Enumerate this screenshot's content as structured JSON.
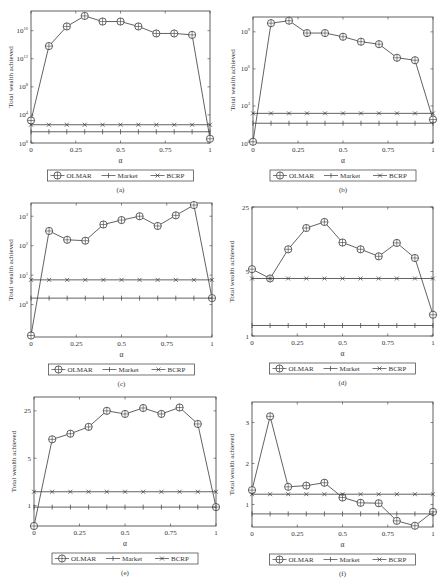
{
  "header": {
    "running_title": "",
    "page_number": ""
  },
  "legend": {
    "entries": [
      {
        "name": "OLMAR",
        "marker": "circle-cross"
      },
      {
        "name": "Market",
        "marker": "plus"
      },
      {
        "name": "BCRP",
        "marker": "x"
      }
    ]
  },
  "chart_data": [
    {
      "panel": "(a)",
      "type": "line",
      "xlabel": "α",
      "ylabel": "Total wealth achieved",
      "yscale": "log",
      "x": [
        0,
        0.1,
        0.2,
        0.3,
        0.4,
        0.5,
        0.6,
        0.7,
        0.8,
        0.9,
        1.0
      ],
      "xticks": [
        0,
        0.25,
        0.5,
        0.75,
        1
      ],
      "xtick_labels": [
        "0",
        "0.25",
        "0.5",
        "0.75",
        "1"
      ],
      "ylim_log10": [
        0,
        18.8
      ],
      "yticks_log10": [
        0,
        4,
        8,
        12,
        16
      ],
      "ytick_labels": [
        "10^0",
        "10^4",
        "10^8",
        "10^12",
        "10^16"
      ],
      "series": [
        {
          "name": "OLMAR",
          "log10_values": [
            3.2,
            13.8,
            16.6,
            18.1,
            17.3,
            17.3,
            16.6,
            15.6,
            15.6,
            15.4,
            0.6
          ]
        },
        {
          "name": "Market",
          "log10_values": [
            1.6,
            1.6,
            1.6,
            1.6,
            1.6,
            1.6,
            1.6,
            1.6,
            1.6,
            1.6,
            1.6
          ]
        },
        {
          "name": "BCRP",
          "log10_values": [
            2.6,
            2.6,
            2.6,
            2.6,
            2.6,
            2.6,
            2.6,
            2.6,
            2.6,
            2.6,
            2.6
          ]
        }
      ],
      "frame": {
        "left": 31,
        "top": 11,
        "right": 210,
        "bottom": 143
      }
    },
    {
      "panel": "(b)",
      "type": "line",
      "xlabel": "α",
      "ylabel": "Total wealth achieved",
      "yscale": "log",
      "x": [
        0,
        0.1,
        0.2,
        0.3,
        0.4,
        0.5,
        0.6,
        0.7,
        0.8,
        0.9,
        1.0
      ],
      "xticks": [
        0,
        0.25,
        0.5,
        0.75,
        1
      ],
      "xtick_labels": [
        "0",
        "0.25",
        "0.5",
        "0.75",
        "1"
      ],
      "ylim_log10": [
        0,
        10.2
      ],
      "yticks_log10": [
        0,
        3,
        6,
        9
      ],
      "ytick_labels": [
        "10^0",
        "10^3",
        "10^6",
        "10^9"
      ],
      "series": [
        {
          "name": "OLMAR",
          "log10_values": [
            0.1,
            9.7,
            9.9,
            8.9,
            8.9,
            8.6,
            8.2,
            8.0,
            6.9,
            6.7,
            1.9
          ]
        },
        {
          "name": "Market",
          "log10_values": [
            1.6,
            1.6,
            1.6,
            1.6,
            1.6,
            1.6,
            1.6,
            1.6,
            1.6,
            1.6,
            1.6
          ]
        },
        {
          "name": "BCRP",
          "log10_values": [
            2.4,
            2.4,
            2.4,
            2.4,
            2.4,
            2.4,
            2.4,
            2.4,
            2.4,
            2.4,
            2.4
          ]
        }
      ],
      "frame": {
        "left": 253,
        "top": 17,
        "right": 433,
        "bottom": 143
      }
    },
    {
      "panel": "(c)",
      "type": "line",
      "xlabel": "α",
      "ylabel": "Total wealth achieved",
      "yscale": "log",
      "x": [
        0,
        0.1,
        0.2,
        0.3,
        0.4,
        0.5,
        0.6,
        0.7,
        0.8,
        0.9,
        1.0
      ],
      "xticks": [
        0,
        0.25,
        0.5,
        0.75,
        1
      ],
      "xtick_labels": [
        "0",
        "0.25",
        "0.5",
        "0.75",
        "1"
      ],
      "ylim_log10": [
        -1.1,
        3.45
      ],
      "yticks_log10": [
        0,
        1,
        2,
        3
      ],
      "ytick_labels": [
        "10^0",
        "10^1",
        "10^2",
        "10^3"
      ],
      "series": [
        {
          "name": "OLMAR",
          "log10_values": [
            -1.05,
            2.5,
            2.2,
            2.17,
            2.72,
            2.87,
            3.0,
            2.67,
            3.03,
            3.38,
            0.22
          ]
        },
        {
          "name": "Market",
          "log10_values": [
            0.22,
            0.22,
            0.22,
            0.22,
            0.22,
            0.22,
            0.22,
            0.22,
            0.22,
            0.22,
            0.22
          ]
        },
        {
          "name": "BCRP",
          "log10_values": [
            0.84,
            0.84,
            0.84,
            0.84,
            0.84,
            0.84,
            0.84,
            0.84,
            0.84,
            0.84,
            0.84
          ]
        }
      ],
      "frame": {
        "left": 31,
        "top": 203,
        "right": 212,
        "bottom": 337
      }
    },
    {
      "panel": "(d)",
      "type": "line",
      "xlabel": "α",
      "ylabel": "Total wealth achieved",
      "yscale": "log",
      "x": [
        0,
        0.1,
        0.2,
        0.3,
        0.4,
        0.5,
        0.6,
        0.7,
        0.8,
        0.9,
        1.0
      ],
      "xticks": [
        0,
        0.25,
        0.5,
        0.75,
        1
      ],
      "xtick_labels": [
        "0",
        "0.25",
        "0.5",
        "0.75",
        "1"
      ],
      "ylim": [
        1,
        25
      ],
      "yticks": [
        1,
        5,
        25
      ],
      "ytick_labels": [
        "1",
        "5",
        "25"
      ],
      "series": [
        {
          "name": "OLMAR",
          "values": [
            5.3,
            4.2,
            8.7,
            14.8,
            17.2,
            10.3,
            8.7,
            7.3,
            10.2,
            7.0,
            1.7
          ]
        },
        {
          "name": "Market",
          "values": [
            1.3,
            1.3,
            1.3,
            1.3,
            1.3,
            1.3,
            1.3,
            1.3,
            1.3,
            1.3,
            1.3
          ]
        },
        {
          "name": "BCRP",
          "values": [
            4.2,
            4.2,
            4.2,
            4.2,
            4.2,
            4.2,
            4.2,
            4.2,
            4.2,
            4.2,
            4.2
          ]
        }
      ],
      "frame": {
        "left": 252,
        "top": 207,
        "right": 433,
        "bottom": 336
      }
    },
    {
      "panel": "(e)",
      "type": "line",
      "xlabel": "α",
      "ylabel": "Total wealth achieved",
      "yscale": "log",
      "x": [
        0,
        0.1,
        0.2,
        0.3,
        0.4,
        0.5,
        0.6,
        0.7,
        0.8,
        0.9,
        1.0
      ],
      "xticks": [
        0,
        0.25,
        0.5,
        0.75,
        1
      ],
      "xtick_labels": [
        "0",
        "0.25",
        "0.5",
        "0.75",
        "1"
      ],
      "ylim": [
        0.5,
        40
      ],
      "yticks": [
        1,
        5,
        25
      ],
      "ytick_labels": [
        "1",
        "5",
        "25"
      ],
      "series": [
        {
          "name": "OLMAR",
          "values": [
            0.5,
            9.5,
            11.5,
            14.5,
            25.0,
            22.5,
            27.5,
            22.5,
            28.0,
            16.0,
            0.95
          ]
        },
        {
          "name": "Market",
          "values": [
            0.95,
            0.95,
            0.95,
            0.95,
            0.95,
            0.95,
            0.95,
            0.95,
            0.95,
            0.95,
            0.95
          ]
        },
        {
          "name": "BCRP",
          "values": [
            1.6,
            1.6,
            1.6,
            1.6,
            1.6,
            1.6,
            1.6,
            1.6,
            1.6,
            1.6,
            1.6
          ]
        }
      ],
      "frame": {
        "left": 34,
        "top": 397,
        "right": 216,
        "bottom": 526
      }
    },
    {
      "panel": "(f)",
      "type": "line",
      "xlabel": "α",
      "ylabel": "Total wealth achieved",
      "yscale": "linear",
      "x": [
        0,
        0.1,
        0.2,
        0.3,
        0.4,
        0.5,
        0.6,
        0.7,
        0.8,
        0.9,
        1.0
      ],
      "xticks": [
        0,
        0.25,
        0.5,
        0.75,
        1
      ],
      "xtick_labels": [
        "0",
        "0.25",
        "0.5",
        "0.75",
        "1"
      ],
      "ylim": [
        0.45,
        3.5
      ],
      "yticks": [
        1,
        2,
        3
      ],
      "ytick_labels": [
        "1",
        "2",
        "3"
      ],
      "series": [
        {
          "name": "OLMAR",
          "values": [
            1.35,
            3.15,
            1.43,
            1.46,
            1.53,
            1.17,
            1.04,
            1.03,
            0.6,
            0.48,
            0.82
          ]
        },
        {
          "name": "Market",
          "values": [
            0.77,
            0.77,
            0.77,
            0.77,
            0.77,
            0.77,
            0.77,
            0.77,
            0.77,
            0.77,
            0.77
          ]
        },
        {
          "name": "BCRP",
          "values": [
            1.25,
            1.25,
            1.25,
            1.25,
            1.25,
            1.25,
            1.25,
            1.25,
            1.25,
            1.25,
            1.25
          ]
        }
      ],
      "frame": {
        "left": 252,
        "top": 402,
        "right": 433,
        "bottom": 527
      }
    }
  ]
}
